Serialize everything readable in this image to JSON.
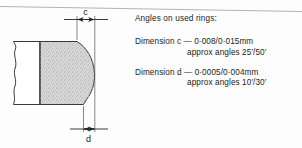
{
  "figure": {
    "type": "engineering-cross-section"
  },
  "drawing": {
    "dimension_top": {
      "label": "c",
      "name": "dimension-c"
    },
    "dimension_bottom": {
      "label": "d",
      "name": "dimension-d"
    }
  },
  "notes": {
    "heading": "Angles on used rings:",
    "entries": [
      {
        "line1": "Dimension c  — 0·008/0·015mm",
        "line2": "approx angles 25′/50′"
      },
      {
        "line1": "Dimension d  — 0·0005/0·004mm",
        "line2": "approx angles 10′/30′"
      }
    ]
  },
  "colors": {
    "ink": "#1c1c1c",
    "line": "#3a3a3a",
    "fill": "#d2d2d2",
    "paper": "#fdfdfd",
    "rule": "#b4b4b4"
  }
}
